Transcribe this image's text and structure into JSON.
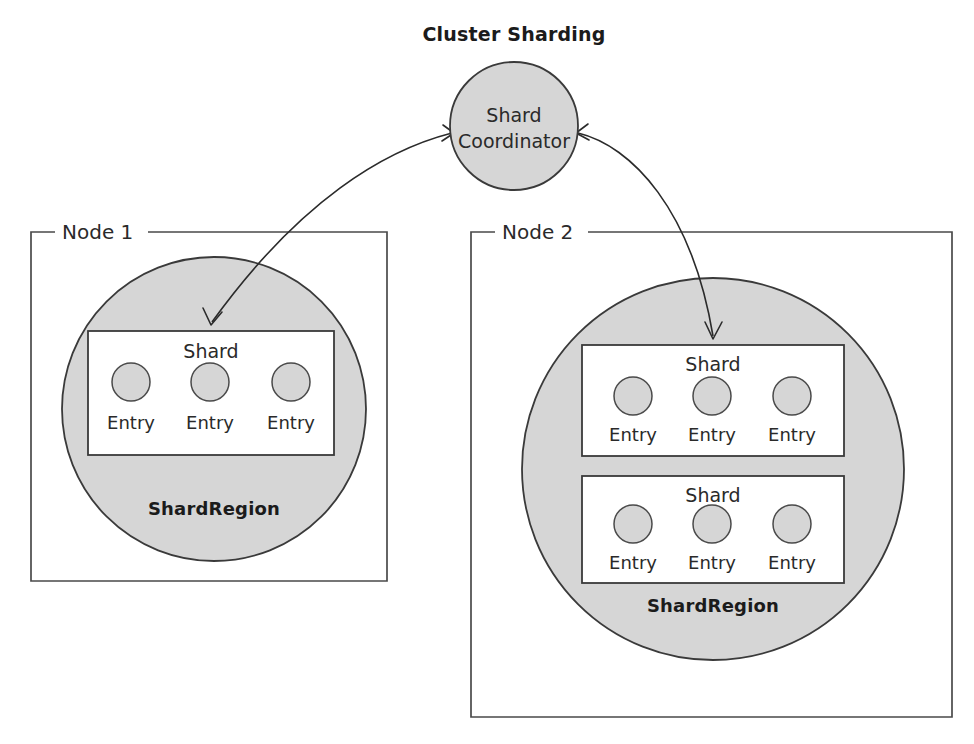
{
  "diagram": {
    "title": "Cluster Sharding",
    "background_color": "#ffffff",
    "shape_fill_color": "#d6d6d6",
    "stroke_color": "#3a3a3a",
    "box_fill_color": "#ffffff"
  },
  "coordinator": {
    "label_line_1": "Shard",
    "label_line_2": "Coordinator",
    "cx": 514,
    "cy": 126,
    "r": 64
  },
  "nodes": [
    {
      "name": "Node 1",
      "frame": {
        "x": 31,
        "y": 232,
        "width": 356,
        "height": 349
      },
      "region": {
        "label": "ShardRegion",
        "cx": 214,
        "cy": 409,
        "r": 152,
        "label_y": 515
      },
      "shards": [
        {
          "label": "Shard",
          "box": {
            "x": 88,
            "y": 331,
            "width": 246,
            "height": 124
          },
          "entries": [
            {
              "label": "Entry",
              "cx": 131,
              "cy": 382,
              "r": 19
            },
            {
              "label": "Entry",
              "cx": 210,
              "cy": 382,
              "r": 19
            },
            {
              "label": "Entry",
              "cx": 291,
              "cy": 382,
              "r": 19
            }
          ]
        }
      ]
    },
    {
      "name": "Node 2",
      "frame": {
        "x": 471,
        "y": 232,
        "width": 481,
        "height": 485
      },
      "region": {
        "label": "ShardRegion",
        "cx": 713,
        "cy": 469,
        "r": 191,
        "label_y": 612
      },
      "shards": [
        {
          "label": "Shard",
          "box": {
            "x": 582,
            "y": 345,
            "width": 262,
            "height": 111
          },
          "entries": [
            {
              "label": "Entry",
              "cx": 633,
              "cy": 396,
              "r": 19
            },
            {
              "label": "Entry",
              "cx": 712,
              "cy": 396,
              "r": 19
            },
            {
              "label": "Entry",
              "cx": 792,
              "cy": 396,
              "r": 19
            }
          ]
        },
        {
          "label": "Shard",
          "box": {
            "x": 582,
            "y": 476,
            "width": 262,
            "height": 107
          },
          "entries": [
            {
              "label": "Entry",
              "cx": 633,
              "cy": 524,
              "r": 19
            },
            {
              "label": "Entry",
              "cx": 712,
              "cy": 524,
              "r": 19
            },
            {
              "label": "Entry",
              "cx": 792,
              "cy": 524,
              "r": 19
            }
          ]
        }
      ]
    }
  ],
  "connections": [
    {
      "id": "coordinator-to-node1-shard",
      "from": "Shard Coordinator",
      "to": "Node 1 Shard",
      "path": "M 452 133 C 385 150, 300 200, 212 322",
      "arrow_start": "M 443 125 L 454 133 L 442 141",
      "arrow_end": "M 203 308 L 211 325 L 222 312"
    },
    {
      "id": "coordinator-to-node2-shard",
      "from": "Shard Coordinator",
      "to": "Node 2 Shard",
      "path": "M 578 133 C 632 146, 692 210, 713 336",
      "arrow_start": "M 588 124 L 576 133 L 589 140",
      "arrow_end": "M 705 322 L 713 339 L 722 322"
    }
  ]
}
